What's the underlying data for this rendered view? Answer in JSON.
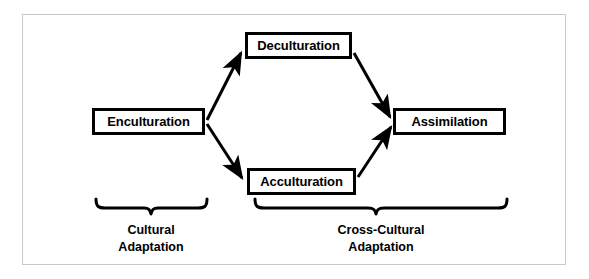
{
  "figure": {
    "type": "flow-diagram",
    "background_color": "#ffffff",
    "stroke_color": "#000000",
    "frame_color": "#c9c9c9"
  },
  "nodes": {
    "enculturation": {
      "label": "Enculturation"
    },
    "deculturation": {
      "label": "Deculturation"
    },
    "acculturation": {
      "label": "Acculturation"
    },
    "assimilation": {
      "label": "Assimilation"
    }
  },
  "groups": {
    "cultural": {
      "line1": "Cultural",
      "line2": "Adaptation"
    },
    "cross_cultural": {
      "line1": "Cross-Cultural",
      "line2": "Adaptation"
    }
  }
}
